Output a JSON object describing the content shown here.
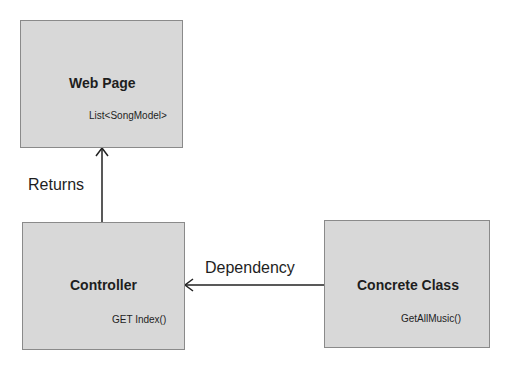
{
  "diagram": {
    "nodes": [
      {
        "id": "web-page",
        "title": "Web Page",
        "subtitle": "List<SongModel>"
      },
      {
        "id": "controller",
        "title": "Controller",
        "subtitle": "GET Index()"
      },
      {
        "id": "concrete-class",
        "title": "Concrete Class",
        "subtitle": "GetAllMusic()"
      }
    ],
    "edges": [
      {
        "from": "controller",
        "to": "web-page",
        "label": "Returns"
      },
      {
        "from": "concrete-class",
        "to": "controller",
        "label": "Dependency"
      }
    ],
    "colors": {
      "box_fill": "#d8d8d8",
      "box_border": "#8a8a8a",
      "line": "#222222"
    }
  }
}
